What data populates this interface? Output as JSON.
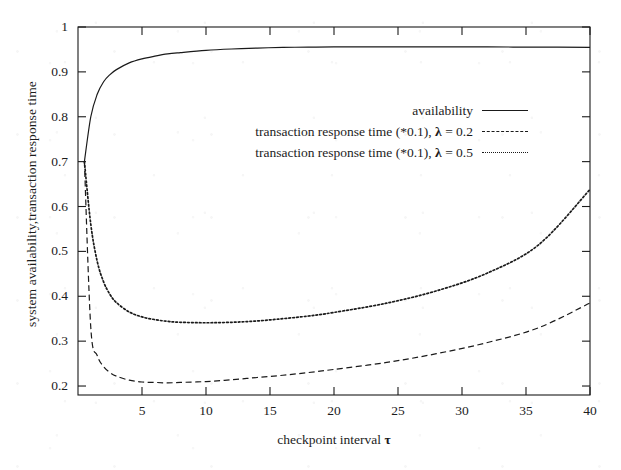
{
  "chart_data": {
    "type": "line",
    "title": "",
    "xlabel": "checkpoint interval τ",
    "ylabel": "system availability,transaction response time",
    "xlim": [
      0,
      40
    ],
    "ylim": [
      0.18,
      1.0
    ],
    "xticks": [
      5,
      10,
      15,
      20,
      25,
      30,
      35,
      40
    ],
    "xtick_labels": [
      "5",
      "10",
      "15",
      "20",
      "25",
      "30",
      "35",
      "40"
    ],
    "yticks": [
      0.2,
      0.3,
      0.4,
      0.5,
      0.6,
      0.7,
      0.8,
      0.9,
      1.0
    ],
    "ytick_labels": [
      "0.2",
      "0.3",
      "0.4",
      "0.5",
      "0.6",
      "0.7",
      "0.8",
      "0.9",
      "1"
    ],
    "grid": false,
    "legend_position": "upper-middle-right",
    "series": [
      {
        "name": "availability",
        "style": "solid",
        "color": "#1a1a1a",
        "x": [
          0.5,
          1,
          1.5,
          2,
          2.5,
          3,
          4,
          5,
          6,
          7,
          8,
          10,
          12,
          14,
          16,
          18,
          20,
          24,
          28,
          32,
          36,
          40
        ],
        "y": [
          0.7,
          0.8,
          0.85,
          0.878,
          0.894,
          0.905,
          0.92,
          0.929,
          0.935,
          0.94,
          0.943,
          0.948,
          0.951,
          0.953,
          0.9545,
          0.9552,
          0.9556,
          0.9558,
          0.9557,
          0.9555,
          0.9552,
          0.9548
        ]
      },
      {
        "name": "transaction response time (*0.1), λ = 0.2",
        "style": "dashed",
        "color": "#1a1a1a",
        "x": [
          0.5,
          1,
          1.5,
          2,
          2.5,
          3,
          4,
          5,
          6,
          7,
          8,
          10,
          12,
          14,
          16,
          18,
          20,
          24,
          28,
          32,
          36,
          40
        ],
        "y": [
          0.7,
          0.33,
          0.268,
          0.243,
          0.23,
          0.222,
          0.213,
          0.209,
          0.208,
          0.207,
          0.208,
          0.21,
          0.214,
          0.219,
          0.224,
          0.23,
          0.237,
          0.252,
          0.272,
          0.297,
          0.33,
          0.385
        ]
      },
      {
        "name": "transaction response time (*0.1), λ = 0.5",
        "style": "dotted",
        "color": "#1a1a1a",
        "x": [
          0.5,
          1,
          1.5,
          2,
          2.5,
          3,
          4,
          5,
          6,
          7,
          8,
          10,
          12,
          14,
          16,
          18,
          20,
          24,
          28,
          32,
          36,
          40
        ],
        "y": [
          0.7,
          0.56,
          0.478,
          0.432,
          0.404,
          0.386,
          0.365,
          0.354,
          0.348,
          0.344,
          0.342,
          0.341,
          0.342,
          0.345,
          0.35,
          0.356,
          0.364,
          0.384,
          0.412,
          0.452,
          0.515,
          0.638
        ]
      }
    ]
  },
  "axis": {
    "y_title": "system availability,transaction response time",
    "x_title_text": "checkpoint interval",
    "x_title_symbol": "τ"
  },
  "legend": {
    "entries": [
      {
        "label": "availability",
        "style": "solid"
      },
      {
        "label_pre": "transaction response time (*0.1), ",
        "label_sym": "λ",
        "label_post": " = 0.2",
        "style": "dashed"
      },
      {
        "label_pre": "transaction response time (*0.1), ",
        "label_sym": "λ",
        "label_post": " = 0.5",
        "style": "dotted"
      }
    ]
  }
}
